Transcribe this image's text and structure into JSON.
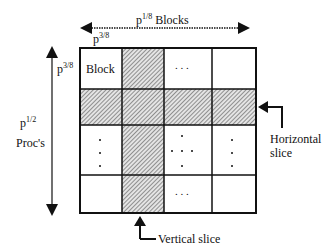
{
  "diagram": {
    "top_label": {
      "base": "p",
      "exponent": "1/8",
      "text": "Blocks"
    },
    "block_width_label": {
      "base": "p",
      "exponent": "3/8"
    },
    "block_height_label": {
      "base": "p",
      "exponent": "3/8"
    },
    "left_label": {
      "base": "p",
      "exponent": "1/2",
      "text": "Proc's"
    },
    "block_cell_label": "Block",
    "ellipsis_h": ". . .",
    "horizontal_slice_label_line1": "Horizontal",
    "horizontal_slice_label_line2": "slice",
    "vertical_slice_label": "Vertical slice",
    "grid": {
      "rows": 4,
      "cols": 4,
      "shaded_row_index": 1,
      "shaded_col_index": 1
    },
    "colors": {
      "line": "#111111",
      "shade": "#b8b8b8",
      "background": "#ffffff"
    }
  }
}
